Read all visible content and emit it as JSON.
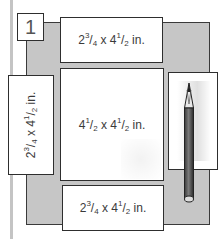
{
  "diagram": {
    "step_number": "1",
    "pieces": {
      "top": {
        "w_whole": "2",
        "w_num": "3",
        "w_den": "4",
        "x": "x",
        "h_whole": "4",
        "h_num": "1",
        "h_den": "2",
        "unit": "in."
      },
      "left": {
        "w_whole": "2",
        "w_num": "3",
        "w_den": "4",
        "x": "x",
        "h_whole": "4",
        "h_num": "1",
        "h_den": "2",
        "unit": "in."
      },
      "center": {
        "w_whole": "4",
        "w_num": "1",
        "w_den": "2",
        "x": "x",
        "h_whole": "4",
        "h_num": "1",
        "h_den": "2",
        "unit": "in."
      },
      "bottom": {
        "w_whole": "2",
        "w_num": "3",
        "w_den": "4",
        "x": "x",
        "h_whole": "4",
        "h_num": "1",
        "h_den": "2",
        "unit": "in."
      }
    },
    "icons": [
      "pencil-icon"
    ],
    "colors": {
      "base_gray": "#c6c6c6",
      "card_fill": "#ffffff",
      "outline": "#2e2e2e",
      "guide_line": "#c4c4c4"
    }
  }
}
